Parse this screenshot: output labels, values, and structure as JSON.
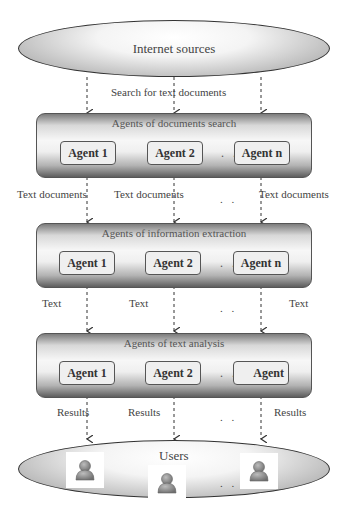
{
  "diagram": {
    "source": {
      "label": "Internet sources"
    },
    "edge_source_to_search": {
      "label": "Search for text documents"
    },
    "layers": [
      {
        "title": "Agents of documents search",
        "agents": [
          "Agent 1",
          "Agent 2",
          "Agent n"
        ],
        "ellipsis": ". .",
        "outputs": [
          "Text documents",
          "Text documents",
          "Text documents"
        ],
        "outputs_ellipsis": ". ."
      },
      {
        "title": "Agents of information extraction",
        "agents": [
          "Agent 1",
          "Agent 2",
          "Agent n"
        ],
        "ellipsis": ". .",
        "outputs": [
          "Text",
          "Text",
          "Text"
        ],
        "outputs_ellipsis": ". ."
      },
      {
        "title": "Agents of text analysis",
        "agents": [
          "Agent 1",
          "Agent 2",
          "Agent"
        ],
        "ellipsis": ". .",
        "outputs": [
          "Results",
          "Results",
          "Results"
        ],
        "outputs_ellipsis": ". ."
      }
    ],
    "sink": {
      "label": "Users",
      "icons": [
        "user-icon",
        "user-icon",
        "user-icon"
      ],
      "ellipsis": ". ."
    },
    "colors": {
      "stroke": "#333333",
      "box_fill": "#efefef",
      "gradient_dark": "#5e5e5e",
      "gradient_light": "#f7f7f7"
    }
  }
}
